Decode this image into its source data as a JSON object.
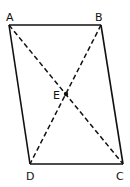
{
  "diagram": {
    "type": "parallelogram-with-diagonals",
    "colors": {
      "stroke": "#111111",
      "background": "#ffffff"
    },
    "vertices": {
      "A": {
        "label": "A",
        "x": 9,
        "y": 25
      },
      "B": {
        "label": "B",
        "x": 101,
        "y": 25
      },
      "C": {
        "label": "C",
        "x": 123,
        "y": 164
      },
      "D": {
        "label": "D",
        "x": 30,
        "y": 164
      },
      "E": {
        "label": "E",
        "x": 66,
        "y": 94
      }
    },
    "sides": [
      "AB",
      "BC",
      "CD",
      "DA"
    ],
    "diagonals": [
      "AC",
      "BD"
    ],
    "diagonal_style": "dashed",
    "intersection_point": "E"
  }
}
